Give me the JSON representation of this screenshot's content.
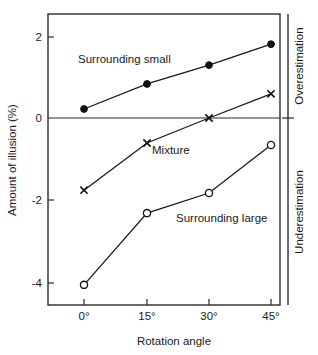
{
  "chart_data": {
    "type": "line",
    "title": "",
    "xlabel": "Rotation angle",
    "ylabel": "Amount of illusion (%)",
    "categories": [
      "0°",
      "15°",
      "30°",
      "45°"
    ],
    "x": [
      0,
      15,
      30,
      45
    ],
    "xlim": [
      -7,
      52
    ],
    "ylim": [
      -4.9,
      2.55
    ],
    "yticks": [
      2,
      0,
      -2,
      -4
    ],
    "ytick_labels": [
      "2",
      "0",
      "-2",
      "-4"
    ],
    "grid": false,
    "legend_position": "inline-annotations",
    "zero_line": 0,
    "series": [
      {
        "name": "Surrounding small",
        "marker": "filled-circle",
        "values": [
          0.22,
          0.83,
          1.29,
          1.8
        ]
      },
      {
        "name": "Mixture",
        "marker": "cross",
        "values": [
          -1.76,
          -0.61,
          0.0,
          0.59
        ]
      },
      {
        "name": "Surrounding large",
        "marker": "open-circle",
        "values": [
          -4.07,
          -2.32,
          -1.83,
          -0.66
        ]
      }
    ],
    "annotations": [
      {
        "text": "Surrounding small",
        "x_px": 78,
        "y_px": 63
      },
      {
        "text": "Mixture",
        "x_px": 152,
        "y_px": 154
      },
      {
        "text": "Surrounding large",
        "x_px": 176,
        "y_px": 222
      }
    ],
    "right_axis_labels": [
      {
        "text": "Overestimation",
        "region": "above-zero"
      },
      {
        "text": "Underestimation",
        "region": "below-zero"
      }
    ]
  },
  "axes": {
    "y_title": "Amount of illusion (%)",
    "x_title": "Rotation angle",
    "y_tick_0": "2",
    "y_tick_1": "0",
    "y_tick_2": "-2",
    "y_tick_3": "-4",
    "x_tick_0": "0°",
    "x_tick_1": "15°",
    "x_tick_2": "30°",
    "x_tick_3": "45°",
    "right_upper": "Overestimation",
    "right_lower": "Underestimation"
  },
  "labels": {
    "series_small": "Surrounding small",
    "series_mixture": "Mixture",
    "series_large": "Surrounding large"
  },
  "colors": {
    "ink": "#1a1a1a",
    "background": "#ffffff"
  }
}
